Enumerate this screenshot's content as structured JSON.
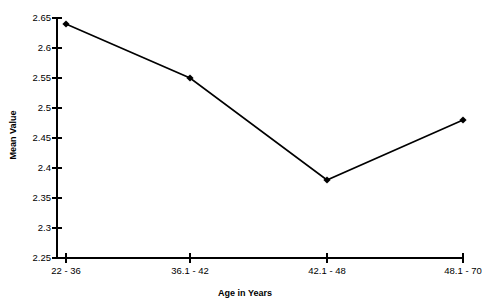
{
  "chart_data": {
    "type": "line",
    "title": "",
    "xlabel": "Age in Years",
    "ylabel": "Mean Value",
    "categories": [
      "22 - 36",
      "36.1 - 42",
      "42.1 - 48",
      "48.1 - 70"
    ],
    "values": [
      2.64,
      2.55,
      2.38,
      2.48
    ],
    "series": [
      {
        "name": "Mean Value",
        "values": [
          2.64,
          2.55,
          2.38,
          2.48
        ]
      }
    ],
    "ylim": [
      2.25,
      2.65
    ],
    "ytick_labels": [
      "2.65",
      "2.6",
      "2.55",
      "2.5",
      "2.45",
      "2.4",
      "2.35",
      "2.3",
      "2.25"
    ],
    "ytick_values": [
      2.65,
      2.6,
      2.55,
      2.5,
      2.45,
      2.4,
      2.35,
      2.3,
      2.25
    ],
    "grid": false,
    "legend": false,
    "marker": "diamond",
    "line_color": "#000000",
    "marker_color": "#000000",
    "background_color": "#ffffff"
  }
}
